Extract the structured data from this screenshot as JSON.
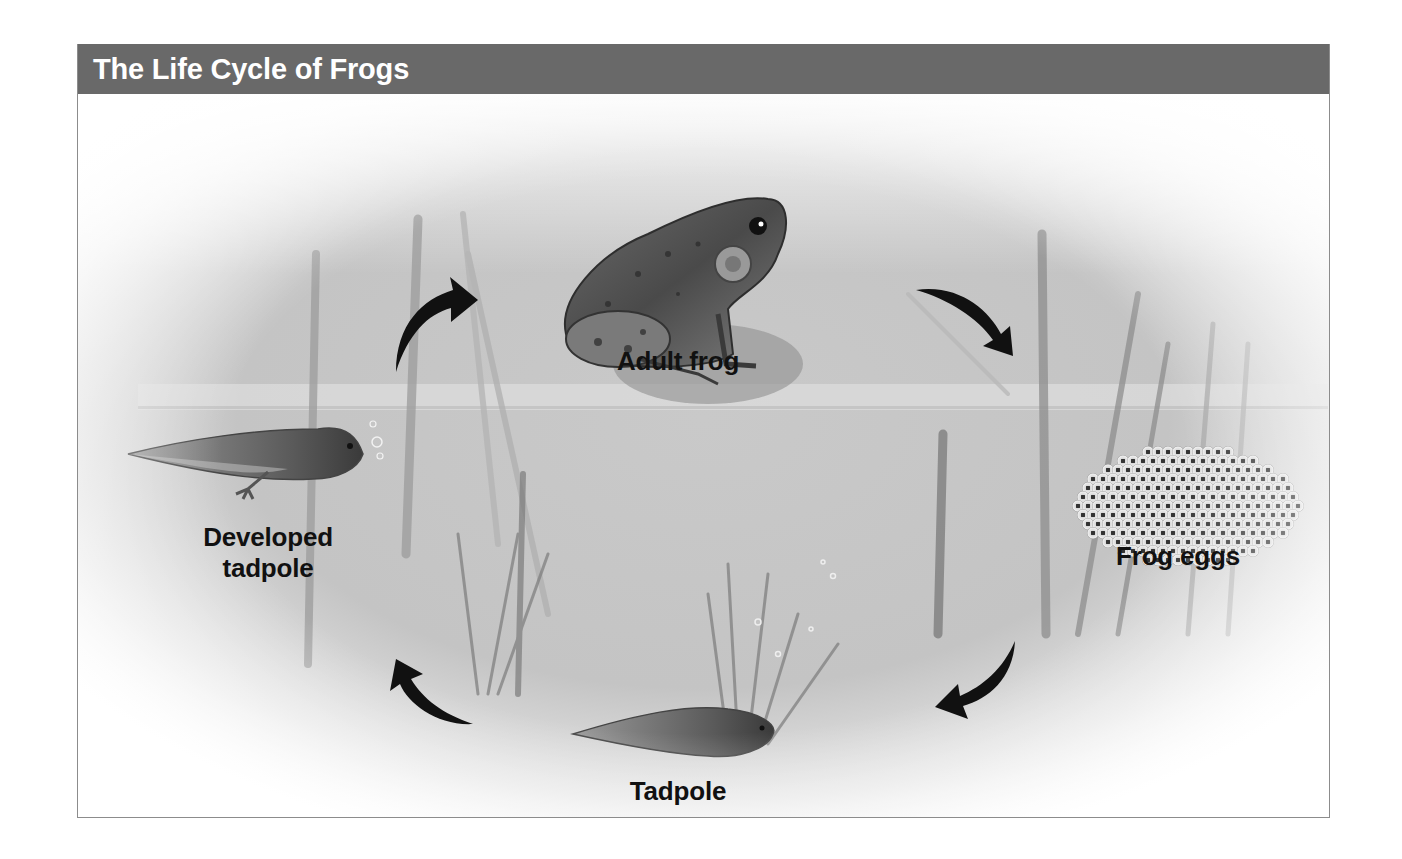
{
  "figure": {
    "title": "The Life Cycle of Frogs",
    "header_color": "#696969",
    "stages": [
      {
        "id": "adult-frog",
        "label": "Adult frog"
      },
      {
        "id": "frog-eggs",
        "label": "Frog eggs"
      },
      {
        "id": "tadpole",
        "label": "Tadpole"
      },
      {
        "id": "developed-tadpole",
        "label": "Developed tadpole",
        "label_lines": [
          "Developed",
          "tadpole"
        ]
      }
    ],
    "cycle_order": [
      "Adult frog",
      "Frog eggs",
      "Tadpole",
      "Developed tadpole",
      "Adult frog"
    ],
    "arrow_color": "#111111"
  }
}
